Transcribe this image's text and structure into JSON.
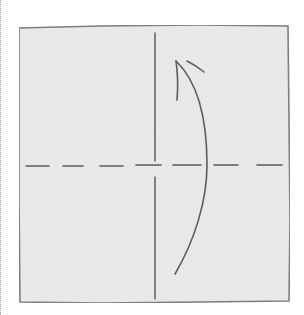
{
  "diagram": {
    "type": "origami-fold-diagram",
    "colors": {
      "background": "#ffffff",
      "paper_fill": "#ececec",
      "paper_edge": "#7d7d7d",
      "line": "#555555",
      "dotted_border": "#9a9a9a"
    },
    "elements": [
      {
        "id": "paper",
        "shape": "square",
        "label": ""
      },
      {
        "id": "crease-vertical",
        "style": "solid",
        "orientation": "vertical",
        "label": ""
      },
      {
        "id": "fold-horizontal",
        "style": "dashed",
        "orientation": "horizontal",
        "label": ""
      },
      {
        "id": "fold-arrow",
        "style": "curved-arrow",
        "direction": "bottom-to-top",
        "label": ""
      }
    ]
  }
}
